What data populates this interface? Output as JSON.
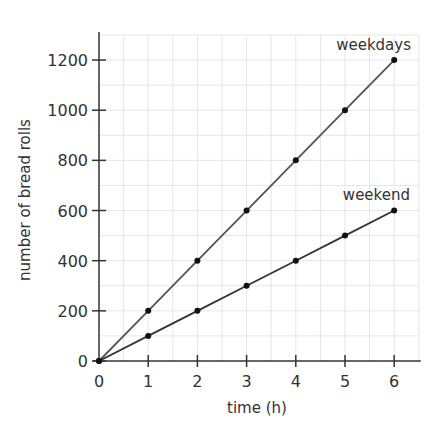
{
  "chart_data": {
    "type": "line",
    "title": "",
    "xlabel": "time (h)",
    "ylabel": "number of bread rolls",
    "x": [
      0,
      1,
      2,
      3,
      4,
      5,
      6
    ],
    "series": [
      {
        "name": "weekdays",
        "values": [
          0,
          200,
          400,
          600,
          800,
          1000,
          1200
        ],
        "color": "#555555"
      },
      {
        "name": "weekend",
        "values": [
          0,
          100,
          200,
          300,
          400,
          500,
          600
        ],
        "color": "#333333"
      }
    ],
    "xticks": [
      "0",
      "1",
      "2",
      "3",
      "4",
      "5",
      "6"
    ],
    "yticks": [
      "0",
      "200",
      "400",
      "600",
      "800",
      "1000",
      "1200"
    ],
    "xlim": [
      0,
      6.5
    ],
    "ylim": [
      0,
      1300
    ],
    "grid": true,
    "legend": "inline labels at line ends"
  }
}
